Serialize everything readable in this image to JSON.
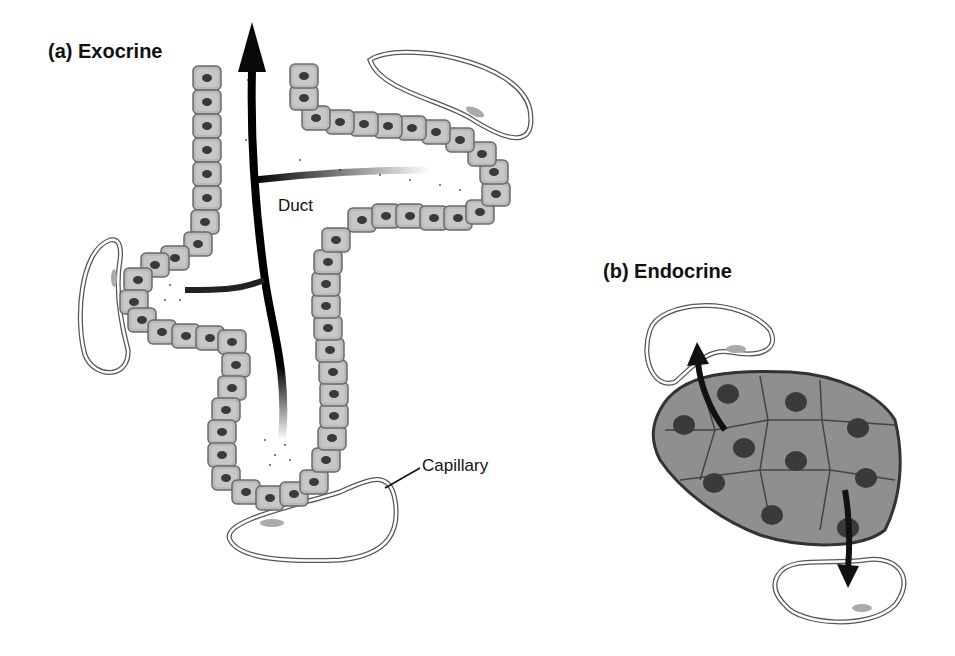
{
  "diagram": {
    "panels": [
      {
        "id": "a",
        "title": "(a) Exocrine",
        "labels": {
          "duct": "Duct",
          "capillary": "Capillary"
        }
      },
      {
        "id": "b",
        "title": "(b) Endocrine"
      }
    ]
  },
  "colors": {
    "cell_fill": "#b9b9b9",
    "cell_stroke": "#6a6a6a",
    "nucleus": "#3a3a3a",
    "duct_arrow": "#0a0a0a",
    "endocrine_fill": "#8f8f8f",
    "capillary_stroke": "#555555"
  }
}
